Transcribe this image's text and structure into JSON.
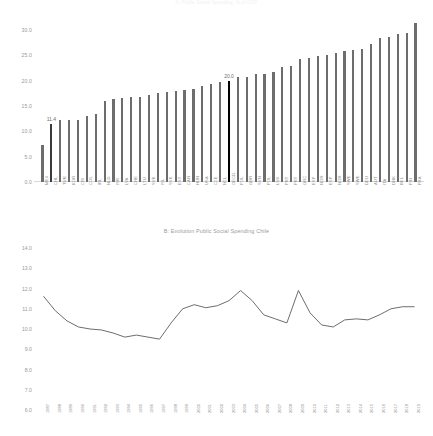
{
  "figure": {
    "title_top": "A: Public Social Spending, % of GDP",
    "caption_b": "B: Evolution Public Social Spending Chile"
  },
  "chart_data": [
    {
      "type": "bar",
      "title": "A: Public Social Spending, % of GDP",
      "xlabel": "",
      "ylabel": "",
      "ylim": [
        0.0,
        32.0
      ],
      "grid": false,
      "yticks": [
        "0.0",
        "5.0",
        "10.0",
        "15.0",
        "20.0",
        "25.0",
        "30.0"
      ],
      "ytick_values": [
        0.0,
        5.0,
        10.0,
        15.0,
        20.0,
        25.0,
        30.0
      ],
      "categories": [
        "MEX",
        "CHL",
        "TUR",
        "KOR",
        "CRI",
        "COL",
        "IRL",
        "NLD",
        "ISR",
        "LVA",
        "CHE",
        "LTU",
        "SVK",
        "ISL",
        "SVK",
        "EST",
        "CAN",
        "HUN",
        "USA",
        "CZE",
        "NZL",
        "OECD",
        "POL",
        "GBR",
        "SVN",
        "POL",
        "LUX",
        "PRT",
        "PRT",
        "GRC",
        "ESP",
        "NOR",
        "ESP",
        "NOR",
        "SWE",
        "SWE",
        "DEU",
        "AUT",
        "ITA",
        "DNK",
        "BEL",
        "FIN",
        "FRA"
      ],
      "values": [
        7.4,
        11.4,
        12.2,
        12.3,
        12.3,
        13.0,
        13.4,
        16.1,
        16.3,
        16.5,
        16.7,
        16.8,
        17.2,
        17.5,
        17.8,
        17.9,
        18.2,
        18.3,
        18.9,
        19.4,
        19.7,
        20.0,
        20.7,
        20.8,
        21.3,
        21.4,
        21.8,
        22.7,
        22.9,
        24.3,
        24.5,
        24.8,
        25.0,
        25.5,
        25.8,
        26.1,
        26.2,
        27.3,
        28.4,
        28.7,
        29.2,
        29.5,
        31.5
      ],
      "annotations": [
        {
          "category": "CHL",
          "label": "11.4",
          "value": 11.4
        },
        {
          "category": "OECD",
          "label": "20.0",
          "value": 20.0
        }
      ],
      "highlight": {
        "CHL": "#3a3a3a",
        "OECD": "#000000"
      },
      "bar_color": "#6d6d6d"
    },
    {
      "type": "line",
      "title": "B: Evolution Public Social Spending Chile",
      "xlabel": "",
      "ylabel": "",
      "ylim": [
        6.0,
        14.0
      ],
      "grid": false,
      "yticks": [
        "6.0",
        "7.0",
        "8.0",
        "9.0",
        "10.0",
        "11.0",
        "12.0",
        "13.0",
        "14.0"
      ],
      "ytick_values": [
        6.0,
        7.0,
        8.0,
        9.0,
        10.0,
        11.0,
        12.0,
        13.0,
        14.0
      ],
      "x": [
        "1987",
        "1988",
        "1989",
        "1990",
        "1991",
        "1992",
        "1993",
        "1994",
        "1995",
        "1996",
        "1997",
        "1998",
        "1999",
        "2000",
        "2001",
        "2002",
        "2003",
        "2004",
        "2005",
        "2006",
        "2007",
        "2008",
        "2009",
        "2010",
        "2011",
        "2012",
        "2013",
        "2014",
        "2015",
        "2016",
        "2017",
        "2018",
        "2019"
      ],
      "values": [
        11.6,
        10.9,
        10.4,
        10.1,
        10.0,
        9.95,
        9.8,
        9.6,
        9.7,
        9.6,
        9.5,
        10.3,
        11.0,
        11.2,
        11.05,
        11.15,
        11.4,
        11.9,
        11.4,
        10.7,
        10.5,
        10.3,
        11.9,
        10.8,
        10.2,
        10.1,
        10.45,
        10.5,
        10.45,
        10.7,
        11.0,
        11.1,
        11.1
      ],
      "line_color": "#5c5c5c"
    }
  ]
}
